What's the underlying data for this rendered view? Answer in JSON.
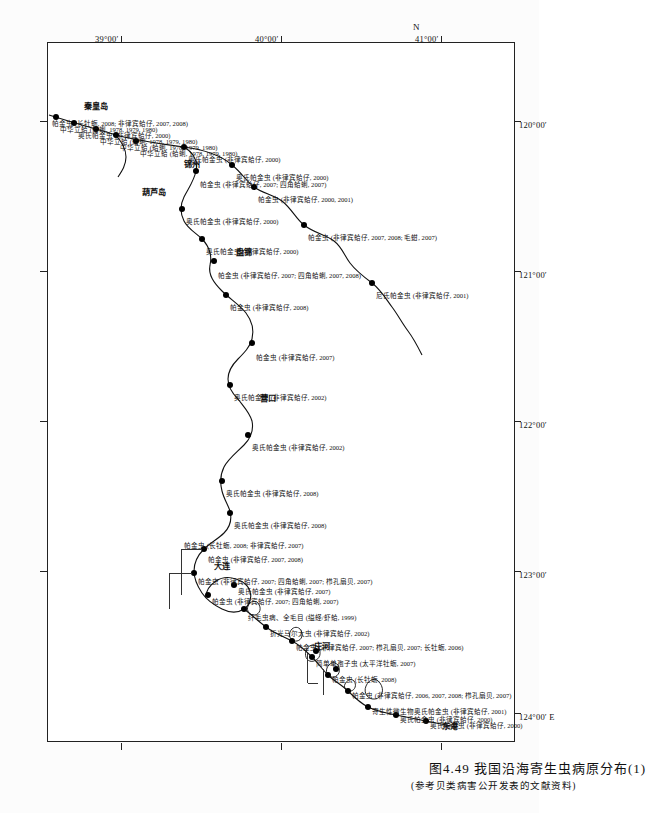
{
  "figure": {
    "caption_main": "图4.49  我国沿海寄生虫病原分布(1)",
    "caption_sub": "(参考贝类病害公开发表的文献资料)",
    "north_mark": "N"
  },
  "axes": {
    "x_labels": [
      "120°00′",
      "121°00′",
      "122°00′",
      "123°00′",
      "124°00′ E"
    ],
    "y_labels": [
      "41°00′",
      "40°00′",
      "39°00′"
    ]
  },
  "cities": [
    {
      "name": "盘锦"
    },
    {
      "name": "锦州"
    },
    {
      "name": "葫芦岛"
    },
    {
      "name": "秦皇岛"
    },
    {
      "name": "营口"
    },
    {
      "name": "大连"
    },
    {
      "name": "庄河"
    },
    {
      "name": "东港"
    }
  ],
  "records": [
    {
      "text": "帕金虫 (非律宾蛤仔, 2007; 四角蛤蜊, 2007, 2008)"
    },
    {
      "text": "帕金虫 (非律宾蛤仔, 2008)"
    },
    {
      "text": "帕金虫 (非律宾蛤仔, 2007)"
    },
    {
      "text": "奥氏帕金虫 (非律宾蛤仔, 2002)"
    },
    {
      "text": "奥氏帕金虫 (非律宾蛤仔, 2002)"
    },
    {
      "text": "奥氏帕金虫 (非律宾蛤仔, 2008)"
    },
    {
      "text": "奥氏帕金虫 (非律宾蛤仔, 2008)"
    },
    {
      "text": "帕金虫 (非律宾蛤仔, 2007; 四角蛤蜊, 2007)"
    },
    {
      "text": "奥氏帕金虫 (非律宾蛤仔, 2000)"
    },
    {
      "text": "奥氏帕金虫 (非律宾蛤仔, 2000)"
    },
    {
      "text": "奥氏帕金虫 (非律宾蛤仔, 2000)"
    },
    {
      "text": "中华立蛤 (蛤蜊, 1978, 1979, 1980)"
    },
    {
      "text": "中华立蛤 (蛤蜊, 1978, 1979, 1980)"
    },
    {
      "text": "中华立蛤 (蛤蜊, 1978, 1979, 1980)"
    },
    {
      "text": "奥氏帕金虫 (非律宾蛤仔, 2000)"
    },
    {
      "text": "中华立蛤 (蛤蜊, 1978, 1979, 1980)"
    },
    {
      "text": "帕金虫 (长牡蛎, 2008; 非律宾蛤仔, 2007, 2008)"
    },
    {
      "text": "奥氏帕金虫 (非律宾蛤仔, 2000)"
    },
    {
      "text": "帕金虫 (非律宾蛤仔, 2000, 2001)"
    },
    {
      "text": "帕金虫 (非律宾蛤仔, 2007, 2008; 毛蚶, 2007)"
    },
    {
      "text": "尼氏帕金虫 (非律宾蛤仔, 2001)"
    },
    {
      "text": "奥氏帕金虫 (非律宾蛤仔, 2000)"
    },
    {
      "text": "奥氏帕金虫 (非律宾蛤仔, 2000)"
    },
    {
      "text": "寄生性微生物奥氏帕金虫 (非律宾蛤仔, 2001)"
    },
    {
      "text": "帕金虫 (非律宾蛤仔, 2006, 2007, 2008; 栉孔扇贝, 2007)"
    },
    {
      "text": "帕金虫 (长牡蛎, 2008)"
    },
    {
      "text": "简单单孢子虫 (太平洋牡蛎, 2007)"
    },
    {
      "text": "帕金虫 (非律宾蛤仔, 2007; 栉孔扇贝, 2007; 长牡蛎, 2006)"
    },
    {
      "text": "折光马尔太虫 (非律宾蛤仔, 2002)"
    },
    {
      "text": "纤毛虫病、全毛目 (缢蛏/虾蛤, 1999)"
    },
    {
      "text": "帕金虫 (非律宾蛤仔, 2007; 四角蛤蜊, 2007)"
    },
    {
      "text": "奥氏帕金虫 (非律宾蛤仔, 2007)"
    },
    {
      "text": "帕金虫 (非律宾蛤仔, 2007; 四角蛤蜊, 2007; 栉孔扇贝, 2007)"
    },
    {
      "text": "帕金虫 (非律宾蛤仔, 2007, 2008)"
    },
    {
      "text": "帕金虫 (长牡蛎, 2008; 非律宾蛤仔, 2007)"
    }
  ]
}
